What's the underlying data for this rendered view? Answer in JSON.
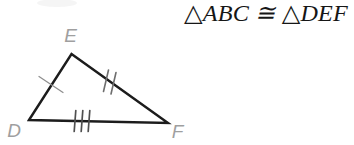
{
  "statement": {
    "text": "△ABC ≅ △DEF",
    "left_triangle": "△ABC",
    "congruent_symbol": "≅",
    "right_triangle": "△DEF"
  },
  "diagram": {
    "vertex_labels": {
      "D": "D",
      "E": "E",
      "F": "F"
    },
    "sides": [
      {
        "side": "DE",
        "tick_marks": 1
      },
      {
        "side": "EF",
        "tick_marks": 2
      },
      {
        "side": "DF",
        "tick_marks": 3
      }
    ]
  },
  "colors": {
    "background": "#ffffff",
    "triangle_line": "#1c1c1c",
    "vertex_label": "#9f9f9f",
    "tick_de": "#8f8f8f",
    "tick_ef": "#6e6e6e",
    "tick_df": "#4f4f4f",
    "statement_text": "#161616",
    "smudge": "#ececec"
  }
}
